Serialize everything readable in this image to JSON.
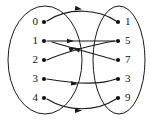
{
  "diagram": {
    "type": "mapping-diagram",
    "stroke_color": "#1a1a1a",
    "background_color": "#ffffff",
    "left_set": {
      "name": "domain-set",
      "ellipse": {
        "cx": 45,
        "cy": 60,
        "rx": 37,
        "ry": 54
      },
      "nodes": [
        {
          "id": "L0",
          "label": "0",
          "dot_x": 44,
          "dot_y": 22,
          "label_x": 38,
          "label_y": 22
        },
        {
          "id": "L1",
          "label": "1",
          "dot_x": 44,
          "dot_y": 41,
          "label_x": 38,
          "label_y": 41
        },
        {
          "id": "L2",
          "label": "2",
          "dot_x": 44,
          "dot_y": 60,
          "label_x": 38,
          "label_y": 60
        },
        {
          "id": "L3",
          "label": "3",
          "dot_x": 44,
          "dot_y": 79,
          "label_x": 38,
          "label_y": 79
        },
        {
          "id": "L4",
          "label": "4",
          "dot_x": 44,
          "dot_y": 98,
          "label_x": 38,
          "label_y": 98
        }
      ]
    },
    "right_set": {
      "name": "codomain-set",
      "ellipse": {
        "cx": 119,
        "cy": 60,
        "rx": 26,
        "ry": 54
      },
      "nodes": [
        {
          "id": "R1",
          "label": "1",
          "dot_x": 118,
          "dot_y": 22,
          "label_x": 125,
          "label_y": 22
        },
        {
          "id": "R5",
          "label": "5",
          "dot_x": 118,
          "dot_y": 41,
          "label_x": 125,
          "label_y": 41
        },
        {
          "id": "R7",
          "label": "7",
          "dot_x": 118,
          "dot_y": 60,
          "label_x": 125,
          "label_y": 60
        },
        {
          "id": "R3",
          "label": "3",
          "dot_x": 118,
          "dot_y": 79,
          "label_x": 125,
          "label_y": 79
        },
        {
          "id": "R9",
          "label": "9",
          "dot_x": 118,
          "dot_y": 98,
          "label_x": 125,
          "label_y": 98
        }
      ]
    },
    "edges": [
      {
        "id": "edge-0-to-1",
        "from": "0",
        "to": "1",
        "path": "M 47 21 C 70 6, 100 10, 116 21",
        "arrow": {
          "x": 82,
          "y": 9.2,
          "angle": 9
        }
      },
      {
        "id": "edge-1-to-5",
        "from": "1",
        "to": "5",
        "path": "M 47 41 C 65 41, 95 41, 115 41",
        "arrow": {
          "x": 74,
          "y": 41,
          "angle": 0
        }
      },
      {
        "id": "edge-2-to-5",
        "from": "2",
        "to": "5",
        "path": "M 47 60 C 62 53, 95 44, 115 41",
        "arrow": {
          "x": 76,
          "y": 47.5,
          "angle": -19
        }
      },
      {
        "id": "edge-7-to-crossing",
        "from": "7",
        "to": "1",
        "path": "M 115 60 C 95 54, 72 48, 52 42",
        "arrow": {
          "x": 73,
          "y": 48.3,
          "angle": 196
        }
      },
      {
        "id": "edge-3-to-3",
        "from": "3",
        "to": "3",
        "path": "M 47 79 C 70 83, 98 86, 116 79",
        "arrow": {
          "x": 78,
          "y": 84.3,
          "angle": 8
        }
      },
      {
        "id": "edge-4-to-9",
        "from": "4",
        "to": "9",
        "path": "M 47 99 C 68 112, 96 112, 116 99",
        "arrow": {
          "x": 82,
          "y": 110.5,
          "angle": -1
        }
      }
    ],
    "arrow_size": {
      "length": 7,
      "width": 4.6
    }
  }
}
